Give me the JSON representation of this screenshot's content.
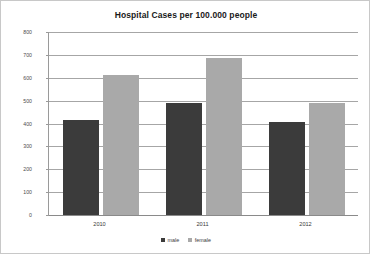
{
  "chart_data": {
    "type": "bar",
    "title": "Hospital Cases per 100.000 people",
    "xlabel": "",
    "ylabel": "",
    "categories": [
      "2010",
      "2011",
      "2012"
    ],
    "series": [
      {
        "name": "male",
        "color": "#3b3b3b",
        "values": [
          415,
          490,
          405
        ]
      },
      {
        "name": "female",
        "color": "#a9a9a9",
        "values": [
          610,
          685,
          490
        ]
      }
    ],
    "ylim": [
      0,
      800
    ],
    "yticks": [
      0,
      100,
      200,
      300,
      400,
      500,
      600,
      700,
      800
    ],
    "ytick_labels": [
      "0",
      "100",
      "200",
      "300",
      "400",
      "500",
      "600",
      "700",
      "800"
    ],
    "grid": true,
    "legend_position": "bottom",
    "legend_entries": [
      "male",
      "female"
    ],
    "plot_background": "#ffffff",
    "gridline_color": "#a6a6a6",
    "frame_border_color": "#c8c8c8"
  }
}
